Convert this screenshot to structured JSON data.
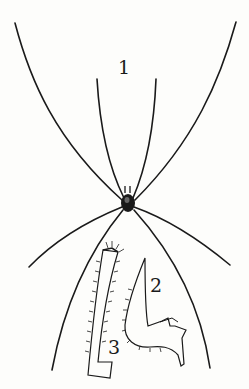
{
  "figure": {
    "labels": [
      {
        "id": "1",
        "text": "1",
        "x": 118,
        "y": 58
      },
      {
        "id": "2",
        "text": "2",
        "x": 150,
        "y": 276
      },
      {
        "id": "3",
        "text": "3",
        "x": 108,
        "y": 340
      }
    ],
    "parts": [
      {
        "label": "1",
        "description": "whole spider, dorsal view with long legs"
      },
      {
        "label": "2",
        "description": "appendage detail (chelicera)"
      },
      {
        "label": "3",
        "description": "appendage detail (palp segment)"
      }
    ],
    "colors": {
      "ink": "#1a1a1a",
      "paper": "#fdfdfb"
    }
  }
}
